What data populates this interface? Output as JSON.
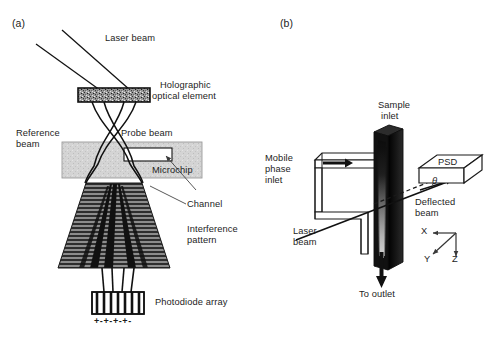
{
  "figure": {
    "background_color": "#ffffff",
    "ink_color": "#1d1d1d"
  },
  "panels": [
    {
      "id": "a",
      "tag": "(a)",
      "caption": "Interferometric backscatter detection on a microchip",
      "labels": {
        "laser_beam": "Laser beam",
        "holographic_optical_element": "Holographic\noptical element",
        "holographic_optical_element_line1": "Holographic",
        "holographic_optical_element_line2": "optical element",
        "reference_beam": "Reference\nbeam",
        "reference_beam_line1": "Reference",
        "reference_beam_line2": "beam",
        "probe_beam": "Probe beam",
        "microchip": "Microchip",
        "channel": "Channel",
        "interference_pattern": "Interference\npattern",
        "interference_pattern_line1": "Interference",
        "interference_pattern_line2": "pattern",
        "photodiode_array": "Photodiode array",
        "electrode_polarity": "+-+-+-+-"
      },
      "colors": {
        "hoe_fill": "#8f8f8f",
        "hoe_border": "#111111",
        "microchip_fill": "#d2d2d2",
        "microchip_border": "#7d7d7d",
        "channel_fill": "#ffffff",
        "channel_border": "#111111",
        "fan_fill": "#2b2b2b",
        "beam_stroke": "#111111",
        "photodiode_fill": "#ffffff",
        "photodiode_border": "#111111"
      }
    },
    {
      "id": "b",
      "tag": "(b)",
      "caption": "Thermal lens / beam deflection detection at a chromatographic column outlet",
      "labels": {
        "sample_inlet": "Sample\ninlet",
        "sample_inlet_line1": "Sample",
        "sample_inlet_line2": "inlet",
        "mobile_phase_inlet": "Mobile\nphase\ninlet",
        "mobile_phase_inlet_line1": "Mobile",
        "mobile_phase_inlet_line2": "phase",
        "mobile_phase_inlet_line3": "inlet",
        "laser_beam": "Laser\nbeam",
        "laser_beam_line1": "Laser",
        "laser_beam_line2": "beam",
        "psd": "PSD",
        "deflected_beam": "Deflected\nbeam",
        "deflected_beam_line1": "Deflected",
        "deflected_beam_line2": "beam",
        "to_outlet": "To outlet",
        "theta": "θ",
        "axis_x": "X",
        "axis_y": "Y",
        "axis_z": "Z"
      },
      "colors": {
        "column_dark": "#141414",
        "column_mid": "#3a3a3a",
        "column_gradient_top": "#101010",
        "column_gradient_bottom": "#cfcfcf",
        "psd_fill": "#ffffff",
        "psd_border": "#1a1a1a",
        "tube_fill": "#ffffff",
        "tube_border": "#1a1a1a",
        "arrow_fill": "#111111"
      }
    }
  ],
  "icons": {
    "arrow_right": "arrow-right-icon",
    "arrow_down": "arrow-down-icon",
    "leader_line": "leader-line-icon"
  }
}
